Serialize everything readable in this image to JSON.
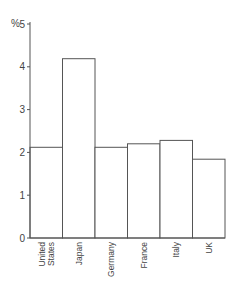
{
  "chart_data": {
    "type": "bar",
    "title": "",
    "xlabel": "",
    "ylabel": "%",
    "ylim": [
      0,
      5
    ],
    "yticks": [
      0,
      1,
      2,
      3,
      4,
      5
    ],
    "grid": false,
    "legend": null,
    "categories": [
      "United States",
      "Japan",
      "Germany",
      "France",
      "Italy",
      "UK"
    ],
    "category_label_lines": [
      [
        "United",
        "States"
      ],
      [
        "Japan"
      ],
      [
        "Germany"
      ],
      [
        "France"
      ],
      [
        "Italy"
      ],
      [
        "UK"
      ]
    ],
    "values": [
      2.12,
      4.19,
      2.12,
      2.2,
      2.28,
      1.84
    ],
    "bar_fill": "#ffffff",
    "bar_stroke": "#555555",
    "axis_color": "#555555"
  },
  "axis": {
    "unit_label": "%"
  }
}
